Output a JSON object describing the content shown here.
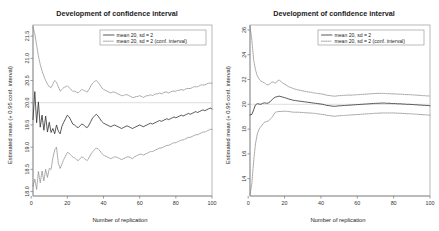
{
  "figure": {
    "panel_count": 2,
    "background_color": "#ffffff"
  },
  "chart_data": [
    {
      "type": "line",
      "panel": "left",
      "title": "Development of confidence interval",
      "xlabel": "Number of replication",
      "ylabel": "Estimated mean (+ 0.95 conf. interval)",
      "xlim": [
        1,
        100
      ],
      "ylim": [
        17.9,
        21.75
      ],
      "xticks": [
        0,
        20,
        40,
        60,
        80,
        100
      ],
      "yticks": [
        18.0,
        18.5,
        19.0,
        19.5,
        20.0,
        20.5,
        21.0,
        21.5
      ],
      "ytick_labels": [
        "18.0",
        "18.5",
        "19.0",
        "19.5",
        "20.0",
        "20.5",
        "21.0",
        "21.5"
      ],
      "xtick_labels": [
        "0",
        "20",
        "40",
        "60",
        "80",
        "100"
      ],
      "grid": false,
      "reference_line_y": 20.0,
      "reference_line_color": "#cfcfcf",
      "legend_position": "top-right",
      "legend": [
        {
          "label": "mean 20, sd = 2",
          "style": "solid",
          "color": "#3a3a3a"
        },
        {
          "label": "mean 20, sd = 2 (conf. interval)",
          "style": "dotted",
          "color": "#7d7d7d"
        }
      ],
      "series": [
        {
          "name": "mean 20, sd = 2",
          "style": "solid",
          "x": [
            1,
            2,
            3,
            4,
            5,
            6,
            7,
            8,
            9,
            10,
            11,
            12,
            13,
            14,
            15,
            16,
            17,
            18,
            19,
            20,
            21,
            22,
            23,
            24,
            25,
            26,
            27,
            28,
            29,
            30,
            31,
            32,
            33,
            34,
            35,
            36,
            37,
            38,
            39,
            40,
            41,
            42,
            43,
            44,
            45,
            46,
            47,
            48,
            49,
            50,
            51,
            52,
            53,
            54,
            55,
            56,
            57,
            58,
            59,
            60,
            61,
            62,
            63,
            64,
            65,
            66,
            67,
            68,
            69,
            70,
            71,
            72,
            73,
            74,
            75,
            76,
            77,
            78,
            79,
            80,
            81,
            82,
            83,
            84,
            85,
            86,
            87,
            88,
            89,
            90,
            91,
            92,
            93,
            94,
            95,
            96,
            97,
            98,
            99,
            100
          ],
          "values": [
            19.62,
            20.25,
            19.55,
            20.02,
            19.45,
            19.72,
            19.38,
            19.7,
            19.34,
            19.56,
            19.33,
            19.42,
            19.3,
            19.5,
            19.36,
            19.3,
            19.47,
            19.56,
            19.64,
            19.72,
            19.68,
            19.6,
            19.52,
            19.5,
            19.46,
            19.44,
            19.48,
            19.52,
            19.5,
            19.46,
            19.44,
            19.5,
            19.58,
            19.66,
            19.7,
            19.74,
            19.7,
            19.64,
            19.58,
            19.54,
            19.52,
            19.5,
            19.48,
            19.46,
            19.48,
            19.5,
            19.48,
            19.46,
            19.44,
            19.42,
            19.44,
            19.46,
            19.48,
            19.46,
            19.44,
            19.42,
            19.44,
            19.46,
            19.48,
            19.5,
            19.48,
            19.46,
            19.48,
            19.5,
            19.52,
            19.54,
            19.52,
            19.54,
            19.56,
            19.58,
            19.6,
            19.58,
            19.6,
            19.62,
            19.64,
            19.62,
            19.64,
            19.66,
            19.68,
            19.66,
            19.68,
            19.7,
            19.72,
            19.7,
            19.72,
            19.74,
            19.76,
            19.74,
            19.76,
            19.78,
            19.8,
            19.78,
            19.8,
            19.82,
            19.84,
            19.82,
            19.84,
            19.86,
            19.88,
            19.86
          ]
        },
        {
          "name": "upper conf. limit",
          "style": "dotted",
          "values": [
            21.7,
            21.55,
            21.3,
            21.05,
            20.86,
            20.72,
            20.6,
            20.5,
            20.42,
            20.36,
            20.34,
            20.42,
            20.5,
            20.46,
            20.36,
            20.26,
            20.3,
            20.34,
            20.36,
            20.38,
            20.34,
            20.3,
            20.26,
            20.26,
            20.24,
            20.22,
            20.26,
            20.3,
            20.28,
            20.26,
            20.24,
            20.3,
            20.38,
            20.44,
            20.48,
            20.5,
            20.46,
            20.4,
            20.34,
            20.3,
            20.28,
            20.26,
            20.24,
            20.22,
            20.24,
            20.24,
            20.22,
            20.2,
            20.18,
            20.16,
            20.16,
            20.18,
            20.18,
            20.16,
            20.14,
            20.12,
            20.12,
            20.14,
            20.14,
            20.16,
            20.14,
            20.12,
            20.14,
            20.16,
            20.16,
            20.18,
            20.16,
            20.18,
            20.2,
            20.2,
            20.22,
            20.2,
            20.22,
            20.24,
            20.24,
            20.22,
            20.24,
            20.26,
            20.26,
            20.26,
            20.28,
            20.28,
            20.3,
            20.28,
            20.3,
            20.32,
            20.32,
            20.32,
            20.34,
            20.36,
            20.36,
            20.36,
            20.38,
            20.4,
            20.4,
            20.4,
            20.42,
            20.44,
            20.44,
            20.44
          ]
        },
        {
          "name": "lower conf. limit",
          "style": "dotted",
          "values": [
            18.12,
            18.28,
            18.05,
            18.45,
            18.2,
            18.46,
            18.24,
            18.5,
            18.32,
            18.52,
            18.5,
            18.76,
            18.94,
            19.0,
            18.64,
            18.52,
            18.62,
            18.72,
            18.8,
            18.88,
            18.86,
            18.82,
            18.78,
            18.76,
            18.72,
            18.7,
            18.74,
            18.78,
            18.76,
            18.72,
            18.7,
            18.76,
            18.84,
            18.9,
            18.94,
            18.98,
            18.96,
            18.92,
            18.86,
            18.82,
            18.8,
            18.78,
            18.76,
            18.74,
            18.76,
            18.78,
            18.78,
            18.76,
            18.74,
            18.72,
            18.74,
            18.76,
            18.78,
            18.78,
            18.76,
            18.74,
            18.78,
            18.8,
            18.82,
            18.84,
            18.84,
            18.82,
            18.84,
            18.86,
            18.88,
            18.9,
            18.9,
            18.92,
            18.94,
            18.96,
            18.98,
            18.98,
            19.0,
            19.02,
            19.04,
            19.04,
            19.06,
            19.08,
            19.1,
            19.1,
            19.12,
            19.14,
            19.16,
            19.16,
            19.18,
            19.2,
            19.22,
            19.22,
            19.24,
            19.26,
            19.28,
            19.28,
            19.3,
            19.32,
            19.34,
            19.34,
            19.36,
            19.38,
            19.4,
            19.4
          ]
        }
      ]
    },
    {
      "type": "line",
      "panel": "right",
      "title": "Development of confidence interval",
      "xlabel": "Number of replication",
      "ylabel": "Estimated mean (+ 0.95 conf. interval)",
      "xlim": [
        1,
        100
      ],
      "ylim": [
        12.6,
        26.4
      ],
      "xticks": [
        0,
        20,
        40,
        60,
        80,
        100
      ],
      "yticks": [
        14,
        16,
        18,
        20,
        22,
        24,
        26
      ],
      "ytick_labels": [
        "14",
        "16",
        "18",
        "20",
        "22",
        "24",
        "26"
      ],
      "xtick_labels": [
        "0",
        "20",
        "40",
        "60",
        "80",
        "100"
      ],
      "grid": false,
      "reference_line_y": 20.0,
      "reference_line_color": "#cfcfcf",
      "legend_position": "top-right",
      "legend": [
        {
          "label": "mean 20, sd = 2",
          "style": "solid",
          "color": "#3a3a3a"
        },
        {
          "label": "mean 20, sd = 2 (conf. interval)",
          "style": "dotted",
          "color": "#7d7d7d"
        }
      ],
      "series": [
        {
          "name": "mean 20, sd = 2",
          "style": "solid",
          "x": [
            1,
            2,
            3,
            4,
            5,
            6,
            7,
            8,
            9,
            10,
            11,
            12,
            13,
            14,
            15,
            16,
            17,
            18,
            19,
            20,
            21,
            22,
            23,
            24,
            25,
            26,
            27,
            28,
            29,
            30,
            31,
            32,
            33,
            34,
            35,
            36,
            37,
            38,
            39,
            40,
            41,
            42,
            43,
            44,
            45,
            46,
            47,
            48,
            49,
            50,
            51,
            52,
            53,
            54,
            55,
            56,
            57,
            58,
            59,
            60,
            61,
            62,
            63,
            64,
            65,
            66,
            67,
            68,
            69,
            70,
            71,
            72,
            73,
            74,
            75,
            76,
            77,
            78,
            79,
            80,
            81,
            82,
            83,
            84,
            85,
            86,
            87,
            88,
            89,
            90,
            91,
            92,
            93,
            94,
            95,
            96,
            97,
            98,
            99,
            100
          ],
          "values": [
            19.15,
            19.18,
            19.55,
            19.95,
            20.05,
            20.02,
            20.0,
            20.08,
            20.12,
            20.08,
            20.1,
            20.2,
            20.35,
            20.5,
            20.58,
            20.62,
            20.66,
            20.62,
            20.58,
            20.54,
            20.5,
            20.44,
            20.4,
            20.36,
            20.32,
            20.3,
            20.28,
            20.26,
            20.24,
            20.22,
            20.2,
            20.18,
            20.16,
            20.14,
            20.12,
            20.1,
            20.08,
            20.06,
            20.04,
            20.02,
            20.0,
            19.96,
            19.92,
            19.9,
            19.88,
            19.86,
            19.84,
            19.84,
            19.86,
            19.88,
            19.88,
            19.9,
            19.9,
            19.92,
            19.92,
            19.94,
            19.94,
            19.96,
            19.96,
            19.98,
            19.98,
            20.0,
            20.0,
            20.02,
            20.02,
            20.04,
            20.04,
            20.06,
            20.06,
            20.08,
            20.08,
            20.08,
            20.1,
            20.1,
            20.1,
            20.08,
            20.08,
            20.08,
            20.06,
            20.06,
            20.06,
            20.04,
            20.04,
            20.04,
            20.02,
            20.02,
            20.0,
            20.0,
            20.0,
            19.98,
            19.98,
            19.96,
            19.96,
            19.94,
            19.94,
            19.92,
            19.92,
            19.9,
            19.9,
            19.88
          ]
        },
        {
          "name": "upper conf. limit",
          "style": "dotted",
          "values": [
            26.3,
            25.2,
            23.6,
            22.8,
            22.3,
            22.05,
            21.88,
            21.8,
            21.72,
            21.6,
            21.56,
            21.66,
            21.8,
            21.78,
            21.7,
            21.88,
            21.96,
            21.84,
            21.72,
            21.62,
            21.54,
            21.44,
            21.38,
            21.32,
            21.26,
            21.22,
            21.18,
            21.14,
            21.12,
            21.08,
            21.06,
            21.02,
            21.0,
            20.98,
            20.96,
            20.92,
            20.9,
            20.88,
            20.86,
            20.84,
            20.82,
            20.78,
            20.74,
            20.72,
            20.7,
            20.68,
            20.66,
            20.66,
            20.68,
            20.7,
            20.7,
            20.72,
            20.72,
            20.74,
            20.74,
            20.74,
            20.74,
            20.76,
            20.76,
            20.78,
            20.78,
            20.8,
            20.8,
            20.82,
            20.82,
            20.84,
            20.84,
            20.86,
            20.86,
            20.88,
            20.88,
            20.88,
            20.88,
            20.88,
            20.88,
            20.86,
            20.86,
            20.86,
            20.84,
            20.84,
            20.84,
            20.82,
            20.82,
            20.82,
            20.8,
            20.8,
            20.78,
            20.78,
            20.78,
            20.76,
            20.76,
            20.74,
            20.74,
            20.72,
            20.72,
            20.7,
            20.7,
            20.68,
            20.68,
            20.66
          ]
        },
        {
          "name": "lower conf. limit",
          "style": "dotted",
          "values": [
            12.7,
            13.6,
            15.4,
            16.8,
            17.6,
            18.0,
            18.2,
            18.4,
            18.56,
            18.6,
            18.66,
            18.78,
            18.92,
            19.16,
            19.36,
            19.4,
            19.42,
            19.42,
            19.44,
            19.44,
            19.44,
            19.42,
            19.4,
            19.38,
            19.36,
            19.36,
            19.36,
            19.36,
            19.34,
            19.34,
            19.32,
            19.32,
            19.3,
            19.3,
            19.28,
            19.28,
            19.26,
            19.24,
            19.22,
            19.2,
            19.18,
            19.16,
            19.12,
            19.1,
            19.08,
            19.06,
            19.04,
            19.04,
            19.06,
            19.08,
            19.08,
            19.1,
            19.1,
            19.12,
            19.12,
            19.14,
            19.14,
            19.16,
            19.16,
            19.18,
            19.18,
            19.2,
            19.2,
            19.22,
            19.22,
            19.24,
            19.24,
            19.26,
            19.26,
            19.28,
            19.28,
            19.28,
            19.3,
            19.3,
            19.3,
            19.3,
            19.3,
            19.3,
            19.3,
            19.3,
            19.3,
            19.28,
            19.28,
            19.28,
            19.26,
            19.26,
            19.24,
            19.24,
            19.24,
            19.22,
            19.22,
            19.2,
            19.2,
            19.18,
            19.18,
            19.16,
            19.16,
            19.14,
            19.14,
            19.12
          ]
        }
      ]
    }
  ]
}
